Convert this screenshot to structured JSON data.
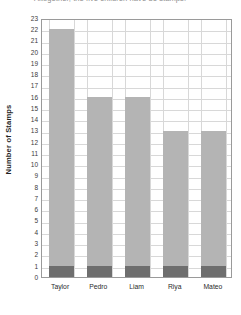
{
  "title": {
    "text": "Altogether, the five children have 81 stamps.",
    "clipped": true
  },
  "axes": {
    "ylabel": "Number of Stamps",
    "xlabel": "",
    "yticks": [
      0,
      1,
      2,
      3,
      4,
      5,
      6,
      7,
      8,
      9,
      10,
      11,
      12,
      13,
      14,
      15,
      16,
      17,
      18,
      19,
      20,
      21,
      22,
      23
    ]
  },
  "colors": {
    "bar_upper": "#b4b4b4",
    "bar_base": "#6e6e6e",
    "grid": "#d8d8d8",
    "frame": "#9a9a9a",
    "background": "#ffffff"
  },
  "chart_data": {
    "type": "bar",
    "title": "Altogether, the five children have 81 stamps.",
    "xlabel": "",
    "ylabel": "Number of Stamps",
    "categories": [
      "Taylor",
      "Pedro",
      "Liam",
      "Riya",
      "Mateo"
    ],
    "values": [
      22,
      16,
      16,
      13,
      13
    ],
    "base_segment_value": 1,
    "ylim": [
      0,
      23
    ],
    "ytick_step": 1,
    "grid": true,
    "legend": "none"
  }
}
